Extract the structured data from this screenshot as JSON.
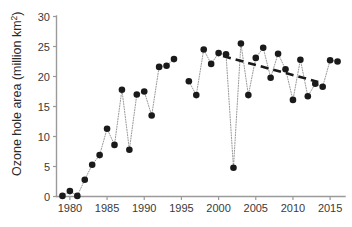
{
  "chart_data": {
    "type": "line",
    "title": "",
    "subtitle": "",
    "xlabel": "",
    "ylabel": "Ozone hole area (million km",
    "ylabel_sup": "2",
    "ylabel_tail": ")",
    "ylabel_full": "Ozone hole area (million km2)",
    "xlim": [
      1978.2,
      1917.0
    ],
    "x_axis_min": 1978.2,
    "x_axis_max": 2017.0,
    "ylim": [
      0,
      30
    ],
    "y_axis_min": 0,
    "y_axis_max": 30,
    "grid": false,
    "legend": false,
    "legend_position": "none",
    "x_ticks": [
      1980,
      1985,
      1990,
      1995,
      2000,
      2005,
      2010,
      2015
    ],
    "x_tick_labels": [
      "1980",
      "1985",
      "1990",
      "1995",
      "2000",
      "2005",
      "2010",
      "2015"
    ],
    "y_ticks": [
      0,
      5,
      10,
      15,
      20,
      25,
      30
    ],
    "y_tick_labels": [
      "0",
      "5",
      "10",
      "15",
      "20",
      "25",
      "30"
    ],
    "marker": "filled-circle",
    "marker_color": "#1a1a1a",
    "connector_style": "dotted",
    "connector_color": "#8d8d8d",
    "series": [
      {
        "name": "Antarctic ozone hole area",
        "x": [
          1979,
          1980,
          1981,
          1982,
          1983,
          1984,
          1985,
          1986,
          1987,
          1988,
          1989,
          1990,
          1991,
          1992,
          1993,
          1994,
          1996,
          1997,
          1998,
          1999,
          2000,
          2001,
          2002,
          2003,
          2004,
          2005,
          2006,
          2007,
          2008,
          2009,
          2010,
          2011,
          2012,
          2013,
          2014,
          2015,
          2016
        ],
        "values": [
          0.1,
          0.9,
          0.1,
          2.8,
          5.3,
          6.9,
          11.3,
          8.6,
          17.8,
          7.8,
          17.0,
          17.5,
          13.5,
          21.6,
          21.8,
          22.9,
          19.2,
          16.9,
          24.5,
          22.1,
          23.9,
          23.7,
          4.8,
          25.5,
          16.9,
          23.1,
          24.8,
          19.8,
          23.8,
          21.2,
          16.1,
          22.8,
          16.7,
          18.8,
          18.3,
          22.7,
          22.5
        ]
      }
    ],
    "missing_years": [
      1995
    ],
    "annotations": [
      {
        "name": "trend-line",
        "type": "dashed-trend",
        "x_start": 2000.6,
        "x_end": 2013.4,
        "y_start": 23.4,
        "y_end": 19.1,
        "style": "dashed",
        "color": "#1a1a1a"
      }
    ]
  },
  "axes": {
    "y_axis_color": "#9a9a9a",
    "x_axis_color": "#9a9a9a",
    "tick_label_color": "#3a3a3a",
    "axis_title_color": "#2b2b2b"
  }
}
